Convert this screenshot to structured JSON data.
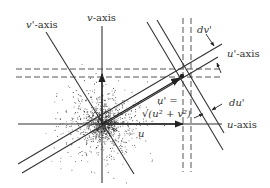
{
  "diagram": {
    "type": "rotated-coordinate-axes-velocity-scatter",
    "labels": {
      "v_prime_axis": {
        "var": "v'",
        "suffix": "-axis"
      },
      "v_axis": {
        "var": "v",
        "suffix": "-axis"
      },
      "u_prime_axis": {
        "var": "u'",
        "suffix": "-axis"
      },
      "u_axis": {
        "var": "u",
        "suffix": "-axis"
      },
      "dv_prime": "dv'",
      "du_prime": "du'",
      "u_vector": "u",
      "u_prime_eq_lhs": "u' =",
      "u_prime_eq_rhs": "√(u² + v²)"
    },
    "colors": {
      "line": "#333333",
      "dash": "#555555",
      "scatter": "#222222",
      "background": "#ffffff"
    },
    "center": {
      "x": 102,
      "y": 124
    }
  }
}
